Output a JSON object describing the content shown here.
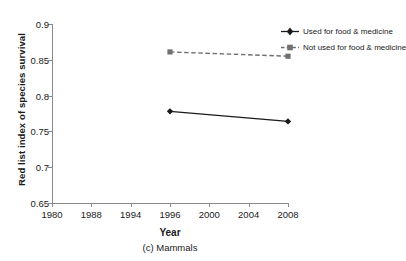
{
  "chart_data": {
    "type": "line",
    "title": "",
    "caption": "(c) Mammals",
    "xlabel": "Year",
    "ylabel": "Red list index of species survival",
    "x": [
      1996,
      2008
    ],
    "xticks": [
      1980,
      1988,
      1994,
      1996,
      2000,
      2004,
      2008
    ],
    "xtick_labels": [
      "1980",
      "1988",
      "1994",
      "1996",
      "2000",
      "2004",
      "2008"
    ],
    "yticks": [
      0.65,
      0.7,
      0.75,
      0.8,
      0.85,
      0.9
    ],
    "ytick_labels": [
      "0.65",
      "0.7",
      "0.75",
      "0.8",
      "0.85",
      "0.9"
    ],
    "ylim": [
      0.65,
      0.9
    ],
    "grid": false,
    "legend_position": "right",
    "series": [
      {
        "name": "Used for food & medicine",
        "values": [
          0.778,
          0.764
        ],
        "color": "#1a1a1a",
        "line_style": "solid",
        "marker": "diamond"
      },
      {
        "name": "Not used for food & medicine",
        "values": [
          0.861,
          0.855
        ],
        "color": "#707070",
        "line_style": "dashed",
        "marker": "square"
      }
    ]
  },
  "legend": {
    "items": [
      {
        "label": "Used for food & medicine"
      },
      {
        "label": "Not used for food & medicine"
      }
    ]
  }
}
